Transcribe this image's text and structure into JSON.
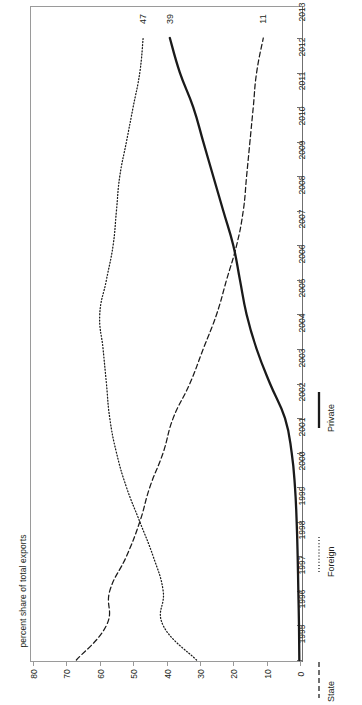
{
  "chart_data": {
    "type": "line",
    "title": "",
    "orientation": "rotated-90",
    "xlabel": "",
    "ylabel": "percent share of total exports",
    "ylim": [
      0,
      80
    ],
    "y_ticks": [
      "80",
      "70",
      "60",
      "50",
      "40",
      "30",
      "20",
      "10",
      "0"
    ],
    "grid": false,
    "legend_position": "right",
    "categories": [
      "1995",
      "1996",
      "1997",
      "1998",
      "1999",
      "2000",
      "2001",
      "2002",
      "2003",
      "2004",
      "2005",
      "2006",
      "2007",
      "2008",
      "2009",
      "2010",
      "2011",
      "2012",
      "2013"
    ],
    "series": [
      {
        "name": "Private",
        "style": "solid",
        "color": "#1a1a1a",
        "values": [
          0.2,
          0.3,
          0.5,
          0.7,
          1.0,
          1.5,
          2.5,
          4.5,
          9.0,
          13.0,
          16.0,
          18.0,
          20.0,
          23.0,
          26.0,
          29.0,
          32.0,
          36.0,
          39
        ],
        "end_label": "39"
      },
      {
        "name": "Foreign",
        "style": "dotted",
        "color": "#1a1a1a",
        "values": [
          31,
          41,
          41,
          44,
          48,
          52,
          55,
          57,
          58,
          59,
          60,
          58,
          56,
          55,
          54,
          52,
          50,
          48,
          47
        ],
        "end_label": "47"
      },
      {
        "name": "State",
        "style": "dashed",
        "color": "#1a1a1a",
        "values": [
          67,
          58,
          57,
          52,
          48,
          45,
          41,
          38,
          33,
          29,
          25,
          22,
          19,
          17,
          16,
          15,
          14,
          13,
          11
        ],
        "end_label": "11"
      }
    ],
    "end_labels": [
      "47",
      "39",
      "11"
    ]
  },
  "axis": {
    "caption": "percent share of total exports",
    "value_ticks": [
      "80",
      "70",
      "60",
      "50",
      "40",
      "30",
      "20",
      "10",
      "0"
    ],
    "category_ticks": [
      "2013",
      "2012",
      "2011",
      "2010",
      "2009",
      "2008",
      "2007",
      "2006",
      "2005",
      "2004",
      "2003",
      "2002",
      "2001",
      "2000",
      "1999",
      "1998",
      "1997",
      "1996",
      "1995"
    ]
  },
  "legend": {
    "items": [
      {
        "label": "Private",
        "style": "solid"
      },
      {
        "label": "Foreign",
        "style": "dotted"
      },
      {
        "label": "State",
        "style": "dashed"
      }
    ]
  },
  "colors": {
    "line": "#1a1a1a",
    "axis": "#9a9a9a",
    "text": "#231f20",
    "background": "#ffffff"
  }
}
